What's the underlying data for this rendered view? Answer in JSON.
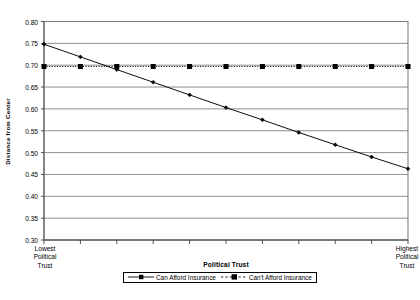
{
  "chart_data": {
    "type": "line",
    "title": "",
    "xlabel": "Political Trust",
    "ylabel": "Distance from Center",
    "ylim": [
      0.3,
      0.8
    ],
    "ystep": 0.05,
    "grid": "horizontal",
    "legend_position": "bottom",
    "categories": [
      "1",
      "2",
      "3",
      "4",
      "5",
      "6",
      "7",
      "8",
      "9",
      "10",
      "11"
    ],
    "x_axis_low_label": "Lowest Political Trust",
    "x_axis_high_label": "Highest Political Trust",
    "ytick_labels": [
      "0.80",
      "0.75",
      "0.70",
      "0.65",
      "0.60",
      "0.55",
      "0.50",
      "0.45",
      "0.40",
      "0.35",
      "0.30"
    ],
    "ytick_values": [
      0.8,
      0.75,
      0.7,
      0.65,
      0.6,
      0.55,
      0.5,
      0.45,
      0.4,
      0.35,
      0.3
    ],
    "series": [
      {
        "name": "Can Afford Insurance",
        "marker": "diamond",
        "line_style": "solid",
        "color": "#000000",
        "values": [
          0.748,
          0.719,
          0.69,
          0.661,
          0.632,
          0.603,
          0.575,
          0.546,
          0.518,
          0.49,
          0.463
        ]
      },
      {
        "name": "Can't Afford Insurance",
        "marker": "square",
        "line_style": "dotted",
        "color": "#000000",
        "values": [
          0.697,
          0.697,
          0.697,
          0.697,
          0.697,
          0.697,
          0.697,
          0.697,
          0.697,
          0.697,
          0.697
        ]
      }
    ]
  },
  "legend": {
    "entries": [
      {
        "label": "Can Afford Insurance"
      },
      {
        "label": "Can't Afford Insurance"
      }
    ]
  },
  "x_labels": {
    "lowest": [
      "Lowest",
      "Political",
      "Trust"
    ],
    "highest": [
      "Highest",
      "Political",
      "Trust"
    ]
  },
  "axis": {
    "y_title": "Distance from Center",
    "x_title": "Political Trust"
  }
}
